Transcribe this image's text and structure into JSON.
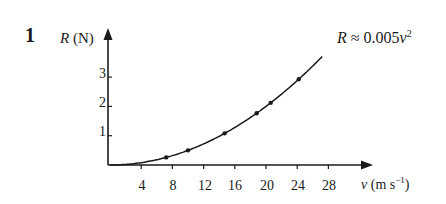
{
  "question_number": "1",
  "chart_data": {
    "type": "scatter",
    "title": "",
    "xlabel": "v (m s^-1)",
    "ylabel": "R (N)",
    "x_ticks": [
      4,
      8,
      12,
      16,
      20,
      24,
      28
    ],
    "y_ticks": [
      1,
      2,
      3
    ],
    "xlim": [
      0,
      33
    ],
    "ylim": [
      0,
      4.5
    ],
    "grid": false,
    "annotation": "R ≈ 0.005v²",
    "series": [
      {
        "name": "measured",
        "type": "scatter",
        "x": [
          7.2,
          10.0,
          14.7,
          18.8,
          20.6,
          24.2
        ],
        "y": [
          0.37,
          0.64,
          1.32,
          2.03,
          2.4,
          3.25
        ]
      },
      {
        "name": "fit R ≈ 0.005v²",
        "type": "line",
        "function": "0.005*v^2",
        "x_range": [
          0,
          27.2
        ]
      }
    ]
  },
  "labels": {
    "y_axis_var": "R",
    "y_axis_unit": "(N)",
    "x_axis_var": "ν",
    "x_axis_unit_pre": "(m s",
    "x_axis_unit_exp": "−1",
    "x_axis_unit_post": ")",
    "eq_var": "R",
    "eq_mid": " ≈ 0.005",
    "eq_var2": "ν",
    "eq_exp": "2"
  },
  "y_tick_labels": [
    "1",
    "2",
    "3"
  ],
  "x_tick_labels": [
    "4",
    "8",
    "12",
    "16",
    "20",
    "24",
    "28"
  ]
}
